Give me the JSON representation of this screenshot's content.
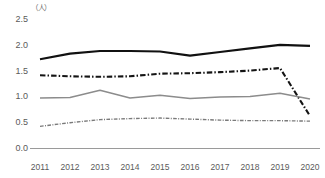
{
  "chart": {
    "title": "",
    "y_unit_label": "（人）",
    "axis_color": "#9a9a9a"
  },
  "chart_data": {
    "type": "line",
    "title": "",
    "subtitle": "",
    "xlabel": "",
    "ylabel": "（人）",
    "categories": [
      "2011",
      "2012",
      "2013",
      "2014",
      "2015",
      "2016",
      "2017",
      "2018",
      "2019",
      "2020"
    ],
    "x": [
      2011,
      2012,
      2013,
      2014,
      2015,
      2016,
      2017,
      2018,
      2019,
      2020
    ],
    "ylim": [
      0.0,
      2.5
    ],
    "ytick_labels": [
      "0.0",
      "0.5",
      "1.0",
      "1.5",
      "2.0",
      "2.5"
    ],
    "yticks": [
      0.0,
      0.5,
      1.0,
      1.5,
      2.0,
      2.5
    ],
    "grid": false,
    "legend": "none",
    "series": [
      {
        "name": "series-1",
        "style": "solid",
        "color": "#111111",
        "width": 2.2,
        "values": [
          1.72,
          1.83,
          1.88,
          1.88,
          1.87,
          1.79,
          1.86,
          1.93,
          2.0,
          1.98
        ]
      },
      {
        "name": "series-2",
        "style": "dash-dot",
        "color": "#141414",
        "width": 2.1,
        "values": [
          1.41,
          1.39,
          1.38,
          1.39,
          1.44,
          1.45,
          1.47,
          1.5,
          1.55,
          0.62
        ]
      },
      {
        "name": "series-3",
        "style": "solid",
        "color": "#8c8c8c",
        "width": 1.5,
        "values": [
          0.97,
          0.98,
          1.12,
          0.97,
          1.02,
          0.96,
          0.99,
          1.0,
          1.06,
          0.95
        ]
      },
      {
        "name": "series-4",
        "style": "dash-dot",
        "color": "#7a7a7a",
        "width": 1.4,
        "values": [
          0.42,
          0.49,
          0.55,
          0.57,
          0.58,
          0.56,
          0.54,
          0.53,
          0.53,
          0.52
        ]
      }
    ]
  }
}
